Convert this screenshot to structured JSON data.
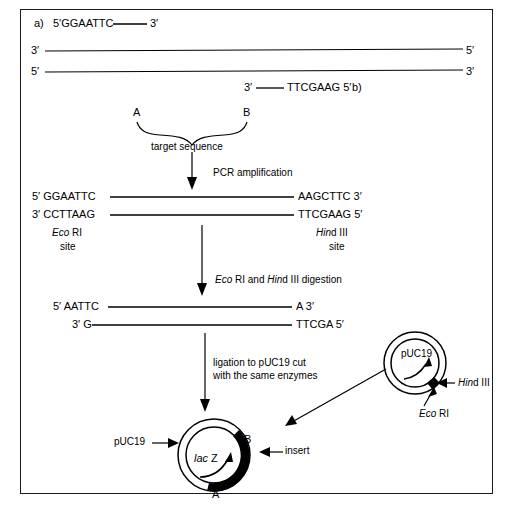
{
  "figure": {
    "type": "molecular-biology-workflow"
  },
  "primers": {
    "a_label": "a)",
    "a_seq": "5′GGAATTC",
    "a_end": "3′",
    "b_label": "b)",
    "b_start": "3′",
    "b_seq": "TTCGAAG 5′"
  },
  "template": {
    "top_left": "3′",
    "top_right": "5′",
    "bottom_left": "5′",
    "bottom_right": "3′"
  },
  "target": {
    "point_a": "A",
    "point_b": "B",
    "caption": "target sequence"
  },
  "steps": {
    "pcr": "PCR amplification",
    "digestion_pre": "Eco",
    "digestion_mid": " RI and ",
    "digestion_hin": "Hin",
    "digestion_post": "d III digestion",
    "ligation_line1": "ligation to pUC19 cut",
    "ligation_line2": "with the same enzymes"
  },
  "product": {
    "top_left": "5′ GGAATTC",
    "top_right": "AAGCTTC 3′",
    "bottom_left": "3′ CCTTAAG",
    "bottom_right": "TTCGAAG 5′",
    "left_site_name": "Eco",
    "left_site_suffix": " RI",
    "left_site_word": "site",
    "right_site_name": "Hin",
    "right_site_suffix": "d III",
    "right_site_word": "site"
  },
  "digested": {
    "top_left": "5′ AATTC",
    "top_right": "A  3′",
    "bottom_left": "3′ G",
    "bottom_right": "TTCGA 5′"
  },
  "vector": {
    "name": "pUC19",
    "cut_hind_name": "Hin",
    "cut_hind_suffix": "d III",
    "cut_eco_name": "Eco",
    "cut_eco_suffix": " RI"
  },
  "recombinant": {
    "vector_label": "pUC19",
    "gene_name": "lac",
    "gene_suffix": " Z",
    "junction_b": "B",
    "junction_a": "A",
    "insert_label": "insert"
  },
  "colors": {
    "ink": "#000000",
    "frame": "#1a1a1a",
    "background": "#ffffff",
    "insert_fill": "#000000"
  }
}
